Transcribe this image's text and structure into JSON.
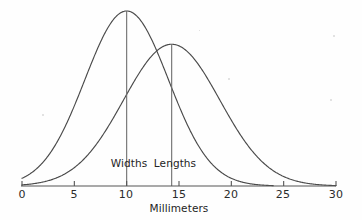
{
  "chart_data": {
    "type": "line",
    "title": "",
    "subtitle": "",
    "xlabel": "Millimeters",
    "ylabel": "",
    "xlim": [
      0,
      30
    ],
    "ylim": [
      0,
      1.0
    ],
    "grid": false,
    "legend_position": "inline-annotations",
    "x_ticks": [
      0,
      5,
      10,
      15,
      20,
      25,
      30
    ],
    "x_tick_labels": [
      "0",
      "5",
      "10",
      "15",
      "20",
      "25",
      "30"
    ],
    "y_ticks": [],
    "y_tick_labels": [],
    "series": [
      {
        "name": "Widths",
        "distribution": "normal",
        "mean": 10.0,
        "std_dev": 4.0,
        "peak_height": 1.0,
        "x_range": [
          0,
          24
        ],
        "color": "#4a4a4a"
      },
      {
        "name": "Lengths",
        "distribution": "normal",
        "mean": 14.3,
        "std_dev": 4.6,
        "peak_height": 0.81,
        "x_range": [
          0,
          30
        ],
        "color": "#4a4a4a"
      }
    ],
    "annotations": [
      {
        "text": "Widths",
        "x": 10.0,
        "kind": "mean-line-label"
      },
      {
        "text": "Lengths",
        "x": 14.3,
        "kind": "mean-line-label"
      }
    ],
    "colors": {
      "background": "#fefefe",
      "axis": "#555555",
      "curve": "#4a4a4a",
      "mean_line": "#6e6e6e",
      "text": "#242424"
    }
  },
  "axis": {
    "title": "Millimeters"
  },
  "curve_labels": [
    {
      "text": "Widths"
    },
    {
      "text": "Lengths"
    }
  ],
  "tick_labels": [
    "0",
    "5",
    "10",
    "15",
    "20",
    "25",
    "30"
  ]
}
